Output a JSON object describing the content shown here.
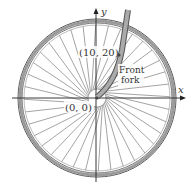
{
  "diagram": {
    "axes": {
      "x_label": "x",
      "y_label": "y"
    },
    "points": [
      {
        "label": "(10, 20)",
        "x": 10,
        "y": 20
      },
      {
        "label": "(0, 0)",
        "x": 0,
        "y": 0
      }
    ],
    "annotations": {
      "fork_line1": "Front",
      "fork_line2": "fork"
    },
    "wheel": {
      "spoke_count": 36,
      "rim_color": "#9a9a9a",
      "line_color": "#444444"
    }
  }
}
